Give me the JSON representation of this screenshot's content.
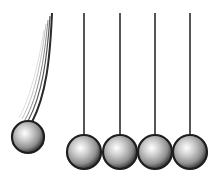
{
  "scene": {
    "title": "Newton's cradle",
    "width": 218,
    "height": 183,
    "colors": {
      "string": "#555555",
      "ball_light": "#ffffff",
      "ball_mid": "#b5b5b5",
      "ball_dark": "#4a4a4a",
      "outline": "#1e1e1e",
      "background": "#ffffff"
    },
    "swinging_ball": {
      "cx": 28,
      "cy": 137,
      "r": 16
    },
    "resting_balls": [
      {
        "cx": 84,
        "cy": 152,
        "r": 17
      },
      {
        "cx": 120,
        "cy": 152,
        "r": 17
      },
      {
        "cx": 155,
        "cy": 152,
        "r": 17
      },
      {
        "cx": 190,
        "cy": 152,
        "r": 17
      }
    ],
    "string_top_y": 13
  }
}
